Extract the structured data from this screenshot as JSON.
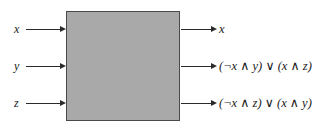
{
  "figure": {
    "type": "block-diagram",
    "box": {
      "fill_color": "#a9a9a9",
      "border_color": "#4a4a4a"
    },
    "wire_color": "#2b2b2b",
    "inputs": [
      {
        "label": "x",
        "arrow": "arrow-right-icon"
      },
      {
        "label": "y",
        "arrow": "arrow-right-icon"
      },
      {
        "label": "z",
        "arrow": "arrow-right-icon"
      }
    ],
    "outputs": [
      {
        "label": "x",
        "arrow": "arrow-right-icon"
      },
      {
        "label": "(¬x ∧ y) ∨ (x ∧ z)",
        "arrow": "arrow-right-icon"
      },
      {
        "label": "(¬x ∧ z) ∨ (x ∧ y)",
        "arrow": "arrow-right-icon"
      }
    ]
  }
}
